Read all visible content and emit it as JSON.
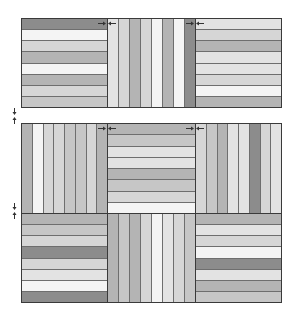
{
  "diagram": {
    "title": "",
    "palette": {
      "dark": "#8c8c8c",
      "mid": "#b4b4b4",
      "lightmid": "#c6c6c6",
      "light": "#d6d6d6",
      "pale": "#e3e3e3",
      "white": "#f4f4f4"
    },
    "blocks": [
      {
        "id": "r1c1",
        "orientation": "h",
        "x": 21,
        "y": 18,
        "w": 87,
        "h": 90,
        "strips": [
          "dark",
          "white",
          "light",
          "mid",
          "white",
          "mid",
          "light",
          "lightmid"
        ]
      },
      {
        "id": "r1c2",
        "orientation": "v",
        "x": 107,
        "y": 18,
        "w": 89,
        "h": 90,
        "strips": [
          "pale",
          "light",
          "mid",
          "light",
          "white",
          "mid",
          "white",
          "dark"
        ]
      },
      {
        "id": "r1c3",
        "orientation": "h",
        "x": 195,
        "y": 18,
        "w": 87,
        "h": 90,
        "strips": [
          "pale",
          "light",
          "mid",
          "pale",
          "pale",
          "light",
          "white",
          "mid"
        ]
      },
      {
        "id": "r2c1",
        "orientation": "v",
        "x": 21,
        "y": 123,
        "w": 87,
        "h": 91,
        "strips": [
          "mid",
          "white",
          "light",
          "light",
          "lightmid",
          "lightmid",
          "light",
          "mid"
        ]
      },
      {
        "id": "r2c2",
        "orientation": "h",
        "x": 107,
        "y": 123,
        "w": 89,
        "h": 91,
        "strips": [
          "mid",
          "lightmid",
          "pale",
          "pale",
          "mid",
          "lightmid",
          "light",
          "white"
        ]
      },
      {
        "id": "r2c3",
        "orientation": "v",
        "x": 195,
        "y": 123,
        "w": 87,
        "h": 91,
        "strips": [
          "light",
          "lightmid",
          "mid",
          "pale",
          "pale",
          "dark",
          "light",
          "pale"
        ]
      },
      {
        "id": "r3c1",
        "orientation": "h",
        "x": 21,
        "y": 213,
        "w": 87,
        "h": 90,
        "strips": [
          "mid",
          "lightmid",
          "light",
          "dark",
          "light",
          "pale",
          "white",
          "dark"
        ]
      },
      {
        "id": "r3c2",
        "orientation": "v",
        "x": 107,
        "y": 213,
        "w": 89,
        "h": 90,
        "strips": [
          "mid",
          "lightmid",
          "mid",
          "light",
          "white",
          "pale",
          "light",
          "lightmid"
        ]
      },
      {
        "id": "r3c3",
        "orientation": "h",
        "x": 195,
        "y": 213,
        "w": 87,
        "h": 90,
        "strips": [
          "mid",
          "pale",
          "light",
          "white",
          "dark",
          "pale",
          "mid",
          "lightmid"
        ]
      }
    ],
    "seam_arrows": [
      {
        "id": "top-seam-1",
        "dir": "h",
        "x": 98,
        "y": 11
      },
      {
        "id": "top-seam-2",
        "dir": "h",
        "x": 186,
        "y": 11
      },
      {
        "id": "mid-seam-1",
        "dir": "h",
        "x": 98,
        "y": 116
      },
      {
        "id": "mid-seam-2",
        "dir": "h",
        "x": 186,
        "y": 116
      },
      {
        "id": "left-seam-1",
        "dir": "v",
        "x": 12,
        "y": 108
      },
      {
        "id": "left-seam-2",
        "dir": "v",
        "x": 12,
        "y": 203
      }
    ],
    "arrow_color": "#333333",
    "border_color": "#3a3a3a"
  }
}
